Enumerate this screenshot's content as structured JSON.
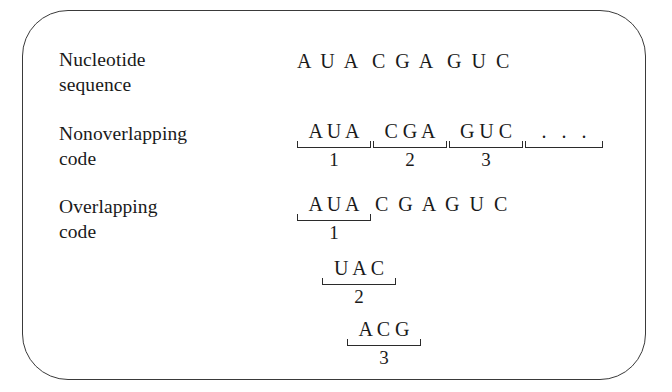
{
  "figure": {
    "kind": "genetic-code-diagram",
    "border_color": "#3a3a3a",
    "background_color": "#ffffff",
    "text_color": "#1a1a1a"
  },
  "rows": {
    "nucleotide_sequence": {
      "label": "Nucleotide\nsequence",
      "letters": "A  U  A   C  G  A   G  U  C"
    },
    "nonoverlapping_code": {
      "label": "Nonoverlapping\ncode",
      "groups": [
        {
          "letters": "A U A",
          "index": "1"
        },
        {
          "letters": "C G A",
          "index": "2"
        },
        {
          "letters": "G U C",
          "index": "3"
        },
        {
          "letters": ".   .   .",
          "index": ""
        }
      ]
    },
    "overlapping_code": {
      "label": "Overlapping\ncode",
      "frames": [
        {
          "letters": "A U A",
          "index": "1",
          "tail": "C  G  A  G  U  C"
        },
        {
          "letters": "U A C",
          "index": "2",
          "tail": ""
        },
        {
          "letters": "A C G",
          "index": "3",
          "tail": ""
        }
      ]
    }
  }
}
